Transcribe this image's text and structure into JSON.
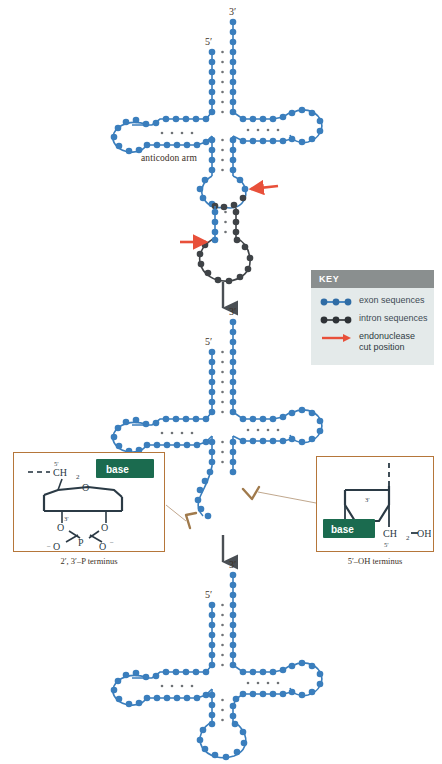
{
  "figure": {
    "colors": {
      "exon": "#3a7ebd",
      "exon_dark": "#2f6ca5",
      "intron": "#3f4347",
      "arrow_red": "#e8503a",
      "process_arrow": "#4a4f54",
      "key_header_bg": "#8a8f8f",
      "key_body_bg": "#e4eaea",
      "inset_border": "#b5763a",
      "callout_line": "#b09070",
      "base_green": "#1b6b4f",
      "text": "#3b2f26"
    }
  },
  "key": {
    "header": "KEY",
    "items": [
      {
        "icon": "three-dot-chain-blue",
        "label": "exon sequences"
      },
      {
        "icon": "three-dot-chain-gray",
        "label": "intron sequences"
      },
      {
        "icon": "red-arrow",
        "label": "endonuclease\ncut position",
        "line1": "endonuclease",
        "line2": "cut position"
      }
    ]
  },
  "stages": {
    "stage1": {
      "name": "pre-tRNA with intron",
      "label_5prime": "5′",
      "label_3prime": "3′",
      "anticodon_label": "anticodon arm",
      "cut_arrows": 2
    },
    "stage2": {
      "name": "cleaved tRNA halves",
      "label_5prime": "5′",
      "label_3prime": "3′"
    },
    "stage3": {
      "name": "ligated mature tRNA",
      "label_5prime": "5′",
      "label_3prime": "3′"
    }
  },
  "insets": {
    "left": {
      "caption": "2′, 3′–P terminus",
      "base_label": "base",
      "atoms": {
        "ch2": "CH",
        "ch2_sub": "2",
        "five_prime": "5′",
        "three_prime": "3′",
        "ring_o": "O",
        "p": "P",
        "o_top_left": "O",
        "o_top_right": "O",
        "o_bottom_left": "O",
        "o_bottom_right": "O",
        "minus": "–"
      }
    },
    "right": {
      "caption": "5′–OH terminus",
      "base_label": "base",
      "atoms": {
        "three_prime": "3′",
        "five_prime": "5′",
        "ring_o": "O",
        "ch2": "CH",
        "ch2_sub": "2",
        "oh": "OH"
      }
    }
  }
}
